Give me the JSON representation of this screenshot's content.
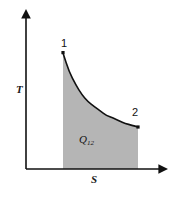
{
  "figure": {
    "type": "temperature-entropy-diagram",
    "background_color": "#ffffff",
    "line_color": "#111111",
    "fill_color": "#b5b5b5"
  },
  "axes": {
    "y_label": "T",
    "x_label": "S",
    "y_axis_name": "temperature-axis",
    "x_axis_name": "entropy-axis",
    "arrowheads": true,
    "origin_px": [
      26,
      169
    ],
    "x_axis_end_px": [
      166,
      169
    ],
    "y_axis_top_px": [
      26,
      13
    ]
  },
  "points": [
    {
      "label": "1",
      "x_px": 63,
      "y_px": 53
    },
    {
      "label": "2",
      "x_px": 138,
      "y_px": 127
    }
  ],
  "area": {
    "label_base": "Q",
    "label_sub": "12",
    "label_full": "Q12"
  },
  "chart_data": {
    "type": "area",
    "title": "",
    "xlabel": "S",
    "ylabel": "T",
    "series": [
      {
        "name": "process-1-2",
        "x": [
          0.0,
          0.08,
          0.17,
          0.25,
          0.33,
          0.42,
          0.5,
          0.58,
          0.67,
          0.75,
          0.83,
          0.92,
          1.0
        ],
        "y": [
          1.0,
          0.79,
          0.64,
          0.53,
          0.45,
          0.39,
          0.34,
          0.29,
          0.26,
          0.23,
          0.2,
          0.18,
          0.16
        ]
      }
    ],
    "annotations": [
      "1",
      "2",
      "Q12"
    ],
    "fill_between": "curve-and-x-axis",
    "xlim": [
      0,
      1
    ],
    "ylim": [
      0,
      1
    ],
    "grid": false,
    "legend": "none",
    "tick_labels": {
      "x": [],
      "y": []
    }
  }
}
